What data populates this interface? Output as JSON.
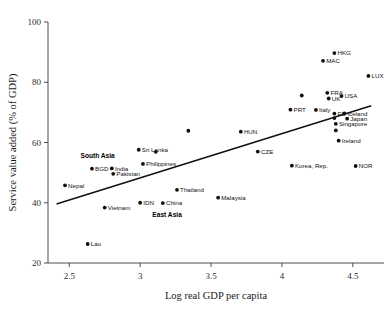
{
  "chart_data": {
    "type": "scatter",
    "title": "",
    "xlabel": "Log real GDP per capita",
    "ylabel": "Service value added (% of GDP)",
    "xlim": [
      2.35,
      4.72
    ],
    "ylim": [
      20,
      100
    ],
    "xticks": [
      2.5,
      3,
      3.5,
      4,
      4.5
    ],
    "xticklabels": [
      "2.5",
      "3",
      "3.5",
      "4",
      "4.5"
    ],
    "yticks": [
      20,
      40,
      60,
      80,
      100
    ],
    "yticklabels": [
      "20",
      "40",
      "60",
      "80",
      "100"
    ],
    "grid": false,
    "legend": "none",
    "marker_color": "#101010",
    "fitline_color": "#111111",
    "fit_line": {
      "x": [
        2.41,
        4.63
      ],
      "y": [
        39.6,
        72.2
      ],
      "label": "linear fit"
    },
    "points": [
      {
        "label": "Nepal",
        "x": 2.47,
        "y": 45.8,
        "lp": "right"
      },
      {
        "label": "Lao",
        "x": 2.63,
        "y": 26.3,
        "lp": "right"
      },
      {
        "label": "BGD",
        "x": 2.66,
        "y": 51.3,
        "lp": "right"
      },
      {
        "label": "Vietnam",
        "x": 2.75,
        "y": 38.4,
        "lp": "right"
      },
      {
        "label": "India",
        "x": 2.8,
        "y": 51.4,
        "lp": "right"
      },
      {
        "label": "Pakistan",
        "x": 2.81,
        "y": 49.6,
        "lp": "right"
      },
      {
        "label": "Sri Lanka",
        "x": 2.99,
        "y": 57.6,
        "lp": "right"
      },
      {
        "label": "",
        "x": 3.11,
        "y": 56.9,
        "lp": "right"
      },
      {
        "label": "Philippines",
        "x": 3.02,
        "y": 52.9,
        "lp": "right"
      },
      {
        "label": "IDN",
        "x": 3.0,
        "y": 40.0,
        "lp": "right"
      },
      {
        "label": "China",
        "x": 3.16,
        "y": 39.9,
        "lp": "right"
      },
      {
        "label": "",
        "x": 3.34,
        "y": 63.9,
        "lp": "right"
      },
      {
        "label": "Thailand",
        "x": 3.26,
        "y": 44.3,
        "lp": "right"
      },
      {
        "label": "Malaysia",
        "x": 3.55,
        "y": 41.7,
        "lp": "right"
      },
      {
        "label": "HUN",
        "x": 3.71,
        "y": 63.6,
        "lp": "right"
      },
      {
        "label": "CZE",
        "x": 3.83,
        "y": 57.0,
        "lp": "right"
      },
      {
        "label": "Korea, Rep.",
        "x": 4.07,
        "y": 52.3,
        "lp": "right"
      },
      {
        "label": "PRT",
        "x": 4.06,
        "y": 70.9,
        "lp": "right"
      },
      {
        "label": "",
        "x": 4.14,
        "y": 75.6,
        "lp": "right"
      },
      {
        "label": "Italy",
        "x": 4.24,
        "y": 70.8,
        "lp": "right"
      },
      {
        "label": "MAC",
        "x": 4.29,
        "y": 87.1,
        "lp": "right"
      },
      {
        "label": "FRA",
        "x": 4.32,
        "y": 76.5,
        "lp": "right"
      },
      {
        "label": "UK",
        "x": 4.33,
        "y": 74.6,
        "lp": "right"
      },
      {
        "label": "HKG",
        "x": 4.37,
        "y": 89.7,
        "lp": "right"
      },
      {
        "label": "EU",
        "x": 4.37,
        "y": 69.6,
        "lp": "right"
      },
      {
        "label": "",
        "x": 4.37,
        "y": 68.1,
        "lp": "right"
      },
      {
        "label": "Singapore",
        "x": 4.38,
        "y": 66.2,
        "lp": "right"
      },
      {
        "label": "",
        "x": 4.38,
        "y": 64.0,
        "lp": "right"
      },
      {
        "label": "USA",
        "x": 4.42,
        "y": 75.4,
        "lp": "right"
      },
      {
        "label": "Iceland",
        "x": 4.44,
        "y": 69.7,
        "lp": "right"
      },
      {
        "label": "Japan",
        "x": 4.46,
        "y": 67.9,
        "lp": "right"
      },
      {
        "label": "Ireland",
        "x": 4.4,
        "y": 60.6,
        "lp": "right"
      },
      {
        "label": "LUX",
        "x": 4.61,
        "y": 82.1,
        "lp": "right"
      },
      {
        "label": "NOR",
        "x": 4.52,
        "y": 52.2,
        "lp": "right"
      }
    ],
    "annotations": [
      {
        "text": "South Asia",
        "x": 2.7,
        "y": 55.0
      },
      {
        "text": "East Asia",
        "x": 3.19,
        "y": 35.3
      }
    ]
  }
}
